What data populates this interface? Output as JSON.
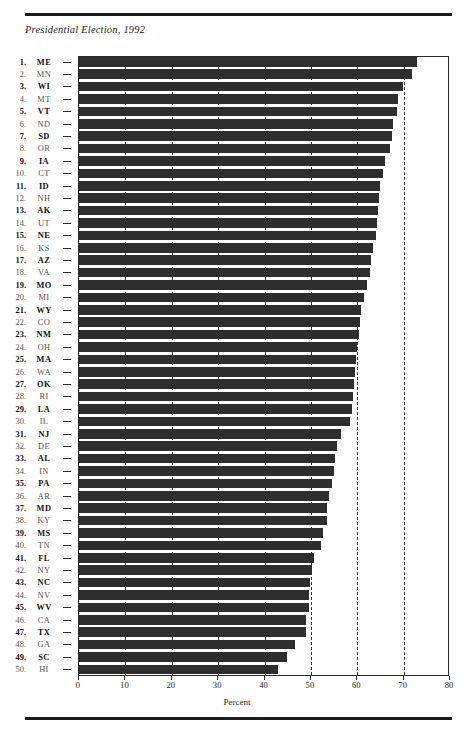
{
  "figure": {
    "title": "Presidential Election, 1992",
    "xlabel": "Percent"
  },
  "chart_data": {
    "type": "bar",
    "orientation": "horizontal",
    "title": "Presidential Election, 1992",
    "xlabel": "Percent",
    "ylabel": "",
    "xlim": [
      0,
      80
    ],
    "xticks": [
      0,
      10,
      20,
      30,
      40,
      50,
      60,
      70,
      80
    ],
    "xticklabels": [
      "0",
      "10",
      "20",
      "30",
      "40",
      "50",
      "60",
      "70",
      "80"
    ],
    "grid": "vertical dashed gridlines at every 10 percent",
    "legend": "none",
    "bar_color": "#2e2e2e",
    "sort": "descending by value",
    "categories": [
      "ME",
      "MN",
      "WI",
      "MT",
      "VT",
      "ND",
      "SD",
      "OR",
      "IA",
      "CT",
      "ID",
      "NH",
      "AK",
      "UT",
      "NE",
      "KS",
      "AZ",
      "VA",
      "MO",
      "MI",
      "WY",
      "CO",
      "NM",
      "OH",
      "MA",
      "WA",
      "OK",
      "RI",
      "LA",
      "IL",
      "NJ",
      "DE",
      "AL",
      "IN",
      "PA",
      "AR",
      "MD",
      "KY",
      "MS",
      "TN",
      "FL",
      "NY",
      "NC",
      "NV",
      "WV",
      "CA",
      "TX",
      "GA",
      "SC",
      "HI"
    ],
    "ranks": [
      1,
      2,
      3,
      4,
      5,
      6,
      7,
      8,
      9,
      10,
      11,
      12,
      13,
      14,
      15,
      16,
      17,
      18,
      19,
      20,
      21,
      22,
      23,
      24,
      25,
      26,
      27,
      28,
      29,
      30,
      31,
      32,
      33,
      34,
      35,
      36,
      37,
      38,
      39,
      40,
      41,
      42,
      43,
      44,
      45,
      46,
      47,
      48,
      49,
      50
    ],
    "values": [
      73.0,
      72.1,
      70.0,
      69.0,
      68.7,
      68.0,
      67.7,
      67.3,
      66.2,
      65.7,
      65.1,
      64.9,
      64.7,
      64.4,
      64.2,
      63.7,
      63.2,
      63.0,
      62.3,
      61.7,
      61.1,
      60.8,
      60.5,
      60.2,
      60.0,
      59.8,
      59.6,
      59.3,
      59.0,
      58.7,
      56.8,
      55.9,
      55.5,
      55.2,
      54.7,
      54.2,
      53.8,
      53.7,
      52.8,
      52.4,
      50.8,
      50.5,
      50.1,
      49.9,
      49.8,
      49.1,
      49.1,
      46.9,
      45.0,
      43.2
    ],
    "series": [
      {
        "name": "Voter turnout",
        "points": [
          {
            "rank": 1,
            "state": "ME",
            "value": 73.0
          },
          {
            "rank": 2,
            "state": "MN",
            "value": 72.1
          },
          {
            "rank": 3,
            "state": "WI",
            "value": 70.0
          },
          {
            "rank": 4,
            "state": "MT",
            "value": 69.0
          },
          {
            "rank": 5,
            "state": "VT",
            "value": 68.7
          },
          {
            "rank": 6,
            "state": "ND",
            "value": 68.0
          },
          {
            "rank": 7,
            "state": "SD",
            "value": 67.7
          },
          {
            "rank": 8,
            "state": "OR",
            "value": 67.3
          },
          {
            "rank": 9,
            "state": "IA",
            "value": 66.2
          },
          {
            "rank": 10,
            "state": "CT",
            "value": 65.7
          },
          {
            "rank": 11,
            "state": "ID",
            "value": 65.1
          },
          {
            "rank": 12,
            "state": "NH",
            "value": 64.9
          },
          {
            "rank": 13,
            "state": "AK",
            "value": 64.7
          },
          {
            "rank": 14,
            "state": "UT",
            "value": 64.4
          },
          {
            "rank": 15,
            "state": "NE",
            "value": 64.2
          },
          {
            "rank": 16,
            "state": "KS",
            "value": 63.7
          },
          {
            "rank": 17,
            "state": "AZ",
            "value": 63.2
          },
          {
            "rank": 18,
            "state": "VA",
            "value": 63.0
          },
          {
            "rank": 19,
            "state": "MO",
            "value": 62.3
          },
          {
            "rank": 20,
            "state": "MI",
            "value": 61.7
          },
          {
            "rank": 21,
            "state": "WY",
            "value": 61.1
          },
          {
            "rank": 22,
            "state": "CO",
            "value": 60.8
          },
          {
            "rank": 23,
            "state": "NM",
            "value": 60.5
          },
          {
            "rank": 24,
            "state": "OH",
            "value": 60.2
          },
          {
            "rank": 25,
            "state": "MA",
            "value": 60.0
          },
          {
            "rank": 26,
            "state": "WA",
            "value": 59.8
          },
          {
            "rank": 27,
            "state": "OK",
            "value": 59.6
          },
          {
            "rank": 28,
            "state": "RI",
            "value": 59.3
          },
          {
            "rank": 29,
            "state": "LA",
            "value": 59.0
          },
          {
            "rank": 30,
            "state": "IL",
            "value": 58.7
          },
          {
            "rank": 31,
            "state": "NJ",
            "value": 56.8
          },
          {
            "rank": 32,
            "state": "DE",
            "value": 55.9
          },
          {
            "rank": 33,
            "state": "AL",
            "value": 55.5
          },
          {
            "rank": 34,
            "state": "IN",
            "value": 55.2
          },
          {
            "rank": 35,
            "state": "PA",
            "value": 54.7
          },
          {
            "rank": 36,
            "state": "AR",
            "value": 54.2
          },
          {
            "rank": 37,
            "state": "MD",
            "value": 53.8
          },
          {
            "rank": 38,
            "state": "KY",
            "value": 53.7
          },
          {
            "rank": 39,
            "state": "MS",
            "value": 52.8
          },
          {
            "rank": 40,
            "state": "TN",
            "value": 52.4
          },
          {
            "rank": 41,
            "state": "FL",
            "value": 50.8
          },
          {
            "rank": 42,
            "state": "NY",
            "value": 50.5
          },
          {
            "rank": 43,
            "state": "NC",
            "value": 50.1
          },
          {
            "rank": 44,
            "state": "NV",
            "value": 49.9
          },
          {
            "rank": 45,
            "state": "WV",
            "value": 49.8
          },
          {
            "rank": 46,
            "state": "CA",
            "value": 49.1
          },
          {
            "rank": 47,
            "state": "TX",
            "value": 49.1
          },
          {
            "rank": 48,
            "state": "GA",
            "value": 46.9
          },
          {
            "rank": 49,
            "state": "SC",
            "value": 45.0
          },
          {
            "rank": 50,
            "state": "HI",
            "value": 43.2
          }
        ]
      }
    ]
  }
}
